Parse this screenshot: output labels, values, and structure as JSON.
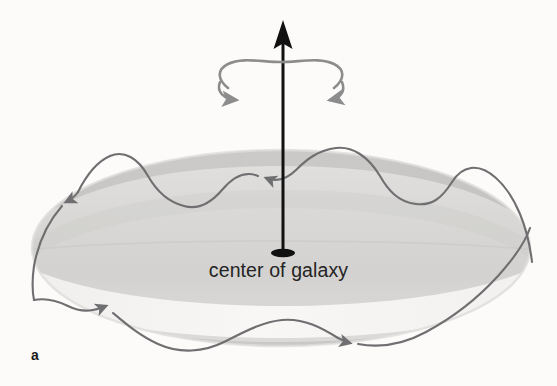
{
  "figure": {
    "panel_label": "a",
    "center_label": "center of galaxy",
    "background_color": "#fcfbfa",
    "width": 557,
    "height": 386
  },
  "axis": {
    "name": "rotation-axis",
    "color": "#111111",
    "arrow_tip_y": 22,
    "base_y": 253,
    "x": 283,
    "line_width": 3
  },
  "rotation_indicator": {
    "name": "rotation-direction-arc",
    "color": "#8c8c8c",
    "center_x": 281,
    "center_y": 81,
    "radius_x": 65,
    "radius_y": 19,
    "direction": "clockwise-from-above"
  },
  "disk": {
    "name": "galactic-disk",
    "center_x": 281,
    "center_y": 248,
    "radius_x": 249,
    "radius_y": 98,
    "top_fill": "#e0dfde",
    "mid_fill": "#d2d1cf",
    "band_fill": "#c6c5c3",
    "bright_fill": "#f6f5f4",
    "rim_fill": "#cfcecc"
  },
  "orbit_path": {
    "name": "stellar-oscillating-orbit",
    "color": "#6f6f71",
    "stroke_width": 2.1,
    "description": "wavy trajectory oscillating above and below the galactic plane",
    "arrowheads": [
      {
        "label": "back-left-arrow",
        "x": 65,
        "y": 203,
        "angle": 212
      },
      {
        "label": "back-center-arrow",
        "x": 258,
        "y": 176,
        "angle": 196
      },
      {
        "label": "back-right-arrow",
        "x": 449,
        "y": 186,
        "angle": 201
      },
      {
        "label": "front-left-arrow",
        "x": 113,
        "y": 313,
        "angle": 47
      },
      {
        "label": "front-right-arrow",
        "x": 352,
        "y": 343,
        "angle": 16
      }
    ]
  },
  "center_marker": {
    "name": "galactic-center-dot",
    "color": "#111111",
    "x": 283,
    "y": 253,
    "radius_x": 12,
    "radius_y": 4.2
  }
}
